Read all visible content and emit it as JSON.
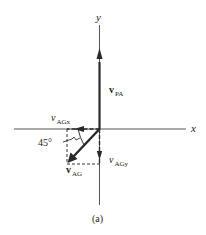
{
  "figure": {
    "caption": "(a)",
    "axes": {
      "x_label": "x",
      "y_label": "y"
    },
    "vectors": {
      "v_pa": {
        "symbol": "v",
        "subscript": "PA",
        "style": "bold",
        "direction": "up (+y)"
      },
      "v_ag": {
        "symbol": "v",
        "subscript": "AG",
        "style": "bold",
        "direction": "down-left (225°)"
      },
      "v_agx": {
        "symbol": "v",
        "subscript": "AGx",
        "style": "italic",
        "direction": "left (-x)"
      },
      "v_agy": {
        "symbol": "v",
        "subscript": "AGy",
        "style": "italic",
        "direction": "down (-y)"
      }
    },
    "angle": {
      "label": "45°",
      "between": "v_AG and -x axis"
    },
    "colors": {
      "line": "#2a2a2a",
      "background": "#ffffff"
    }
  }
}
